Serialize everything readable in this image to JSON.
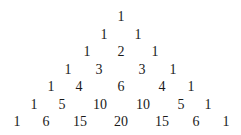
{
  "rows": [
    {
      "y": 17,
      "cells": [
        {
          "v": "1",
          "x": 121
        }
      ]
    },
    {
      "y": 35,
      "cells": [
        {
          "v": "1",
          "x": 104
        },
        {
          "v": "1",
          "x": 138
        }
      ]
    },
    {
      "y": 52,
      "cells": [
        {
          "v": "1",
          "x": 87
        },
        {
          "v": "2",
          "x": 121
        },
        {
          "v": "1",
          "x": 155
        }
      ]
    },
    {
      "y": 70,
      "cells": [
        {
          "v": "1",
          "x": 68
        },
        {
          "v": "3",
          "x": 99
        },
        {
          "v": "3",
          "x": 142
        },
        {
          "v": "1",
          "x": 173
        }
      ]
    },
    {
      "y": 87,
      "cells": [
        {
          "v": "1",
          "x": 51
        },
        {
          "v": "4",
          "x": 79
        },
        {
          "v": "6",
          "x": 121
        },
        {
          "v": "4",
          "x": 162
        },
        {
          "v": "1",
          "x": 191
        }
      ]
    },
    {
      "y": 105,
      "cells": [
        {
          "v": "1",
          "x": 34
        },
        {
          "v": "5",
          "x": 62
        },
        {
          "v": "10",
          "x": 100
        },
        {
          "v": "10",
          "x": 143
        },
        {
          "v": "5",
          "x": 181
        },
        {
          "v": "1",
          "x": 208
        }
      ]
    },
    {
      "y": 122,
      "cells": [
        {
          "v": "1",
          "x": 17
        },
        {
          "v": "6",
          "x": 46
        },
        {
          "v": "15",
          "x": 80
        },
        {
          "v": "20",
          "x": 121
        },
        {
          "v": "15",
          "x": 162
        },
        {
          "v": "6",
          "x": 196
        },
        {
          "v": "1",
          "x": 226
        }
      ]
    }
  ]
}
